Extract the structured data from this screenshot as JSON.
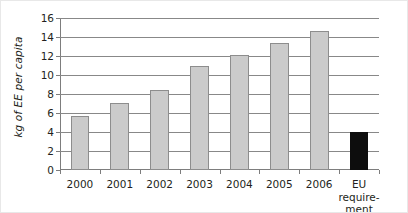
{
  "chart_data": {
    "type": "bar",
    "title": "",
    "xlabel": "",
    "ylabel": "kg of EE per capita",
    "categories": [
      "2000",
      "2001",
      "2002",
      "2003",
      "2004",
      "2005",
      "2006",
      "EU\nrequire-\nment"
    ],
    "values": [
      5.7,
      7.1,
      8.4,
      11.0,
      12.1,
      13.4,
      14.6,
      4.0
    ],
    "bar_colors": [
      "#cbcbcb",
      "#cbcbcb",
      "#cbcbcb",
      "#cbcbcb",
      "#cbcbcb",
      "#cbcbcb",
      "#cbcbcb",
      "#0d0d0d"
    ],
    "ylim": [
      0,
      16
    ],
    "ytick_labels": [
      "0",
      "2",
      "4",
      "6",
      "8",
      "10",
      "12",
      "14",
      "16"
    ],
    "ytick_values": [
      0,
      2,
      4,
      6,
      8,
      10,
      12,
      14,
      16
    ],
    "grid": "horizontal",
    "legend": "none",
    "annotations": []
  }
}
